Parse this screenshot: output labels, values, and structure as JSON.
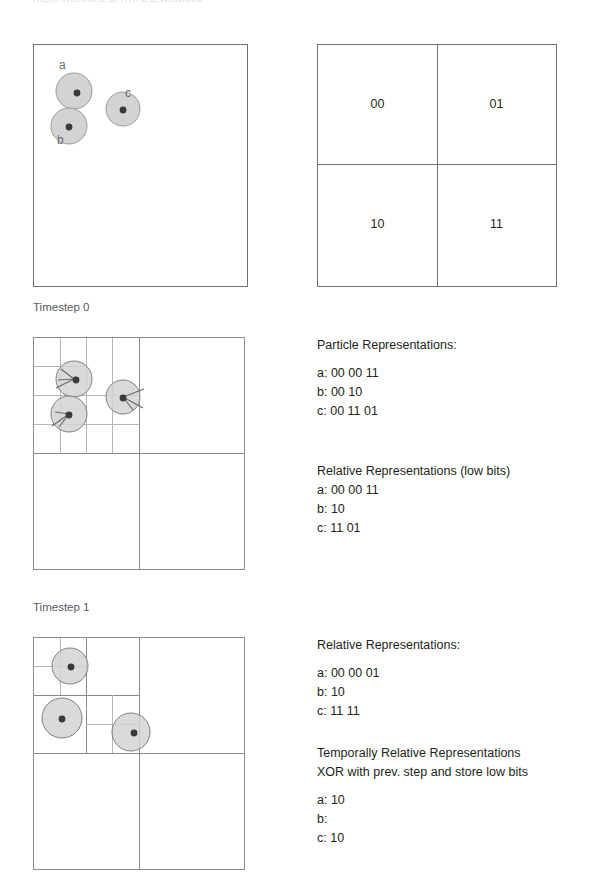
{
  "header": {
    "ghost_text": "HIERARCHICAL SPATIAL ENCODING"
  },
  "colors": {
    "particle_fill": "#d3d3d3",
    "particle_stroke": "#9a9a9d",
    "particle_center": "#3a3a3c",
    "grid_line": "#8a8a8d",
    "grid_line_faint": "#b6b6b9",
    "box_border": "#6f6f72",
    "caption_text": "#58585b",
    "body_text": "#231f20"
  },
  "panels": {
    "continuous_space": {
      "name": "continuous-space-panel",
      "particles": [
        {
          "id": "a",
          "label": "a",
          "cx": 73,
          "cy": 90,
          "r": 18
        },
        {
          "id": "b",
          "label": "b",
          "cx": 68,
          "cy": 125,
          "r": 18
        },
        {
          "id": "c",
          "label": "c",
          "cx": 122,
          "cy": 108,
          "r": 17
        }
      ],
      "labels": [
        {
          "text": "a",
          "x": 58,
          "y": 58
        },
        {
          "text": "b",
          "x": 56,
          "y": 132
        },
        {
          "text": "c",
          "x": 124,
          "y": 86
        }
      ]
    },
    "quadrant_key": {
      "name": "quadrant-key-panel",
      "cells": [
        {
          "code": "00",
          "row": 0,
          "col": 0
        },
        {
          "code": "01",
          "row": 0,
          "col": 1
        },
        {
          "code": "10",
          "row": 1,
          "col": 0
        },
        {
          "code": "11",
          "row": 1,
          "col": 1
        }
      ]
    },
    "timestep0": {
      "caption": "Timestep 0",
      "particles": [
        {
          "id": "a",
          "cx": 73,
          "cy": 378,
          "r": 18
        },
        {
          "id": "b",
          "cx": 68,
          "cy": 413,
          "r": 18
        },
        {
          "id": "c",
          "cx": 122,
          "cy": 396,
          "r": 17
        }
      ]
    },
    "timestep1": {
      "caption": "Timestep 1",
      "particles": [
        {
          "id": "a",
          "cx": 68,
          "cy": 655,
          "r": 18
        },
        {
          "id": "b",
          "cx": 62,
          "cy": 706,
          "r": 20
        },
        {
          "id": "c",
          "cx": 130,
          "cy": 722,
          "r": 19
        }
      ]
    }
  },
  "text_blocks": {
    "timestep0": [
      {
        "heading": "Particle Representations:",
        "lines": [
          "a: 00 00 11",
          "b: 00 10",
          "c: 00 11 01"
        ]
      },
      {
        "heading": "Relative Representations (low bits)",
        "lines": [
          "a: 00 00 11",
          "b: 10",
          "c: 11 01"
        ]
      }
    ],
    "timestep1": [
      {
        "heading": "Relative Representations:",
        "lines": [
          "a: 00 00 01",
          "b: 10",
          "c: 11 11"
        ]
      },
      {
        "heading": "Temporally Relative Representations",
        "heading2": "XOR with prev. step and store low bits",
        "lines": [
          "a: 10",
          "b:",
          "c: 10"
        ]
      }
    ]
  }
}
